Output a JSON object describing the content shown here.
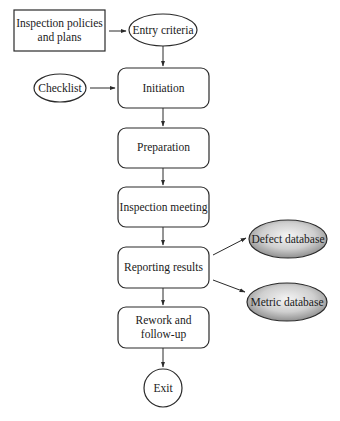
{
  "diagram": {
    "type": "flowchart",
    "title": "",
    "nodes": {
      "policies": {
        "lines": [
          "Inspection policies",
          "and plans"
        ],
        "shape": "rectangle"
      },
      "entry": {
        "label": "Entry criteria",
        "shape": "ellipse"
      },
      "checklist": {
        "label": "Checklist",
        "shape": "ellipse"
      },
      "initiation": {
        "label": "Initiation",
        "shape": "rounded-rectangle"
      },
      "preparation": {
        "label": "Preparation",
        "shape": "rounded-rectangle"
      },
      "meeting": {
        "label": "Inspection meeting",
        "shape": "rounded-rectangle"
      },
      "reporting": {
        "label": "Reporting results",
        "shape": "rounded-rectangle"
      },
      "defect_db": {
        "label": "Defect database",
        "shape": "shaded-ellipse"
      },
      "metric_db": {
        "label": "Metric database",
        "shape": "shaded-ellipse"
      },
      "rework": {
        "lines": [
          "Rework and",
          "follow-up"
        ],
        "shape": "rounded-rectangle"
      },
      "exit": {
        "label": "Exit",
        "shape": "circle"
      }
    },
    "edges": [
      {
        "from": "policies",
        "to": "entry"
      },
      {
        "from": "entry",
        "to": "initiation"
      },
      {
        "from": "checklist",
        "to": "initiation"
      },
      {
        "from": "initiation",
        "to": "preparation"
      },
      {
        "from": "preparation",
        "to": "meeting"
      },
      {
        "from": "meeting",
        "to": "reporting"
      },
      {
        "from": "reporting",
        "to": "defect_db"
      },
      {
        "from": "reporting",
        "to": "metric_db"
      },
      {
        "from": "reporting",
        "to": "rework"
      },
      {
        "from": "rework",
        "to": "exit"
      }
    ],
    "colors": {
      "stroke": "#2a2a2a",
      "db_fill_light": "#f2f2f2",
      "db_fill_dark": "#8c8c8c"
    }
  }
}
